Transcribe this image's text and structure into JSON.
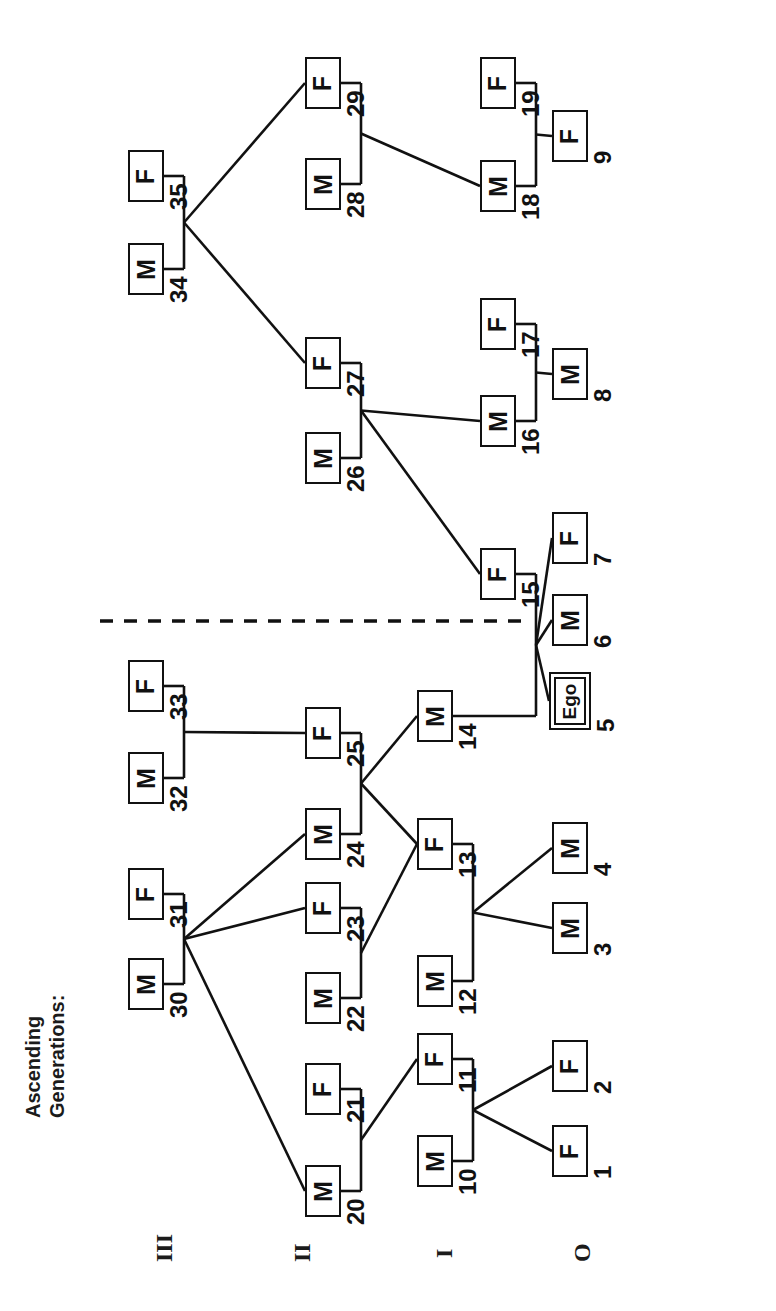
{
  "figure": {
    "caption_line1": "Ascending",
    "caption_line2": "Generations:",
    "orientation": "rotated-90-ccw",
    "ink_color": "#111111",
    "background_color": "#ffffff"
  },
  "generation_labels": [
    {
      "id": "gen-3",
      "label": "III",
      "x": 152,
      "y": 1262
    },
    {
      "id": "gen-2",
      "label": "II",
      "x": 290,
      "y": 1262
    },
    {
      "id": "gen-1",
      "label": "I",
      "x": 432,
      "y": 1258
    },
    {
      "id": "gen-0",
      "label": "O",
      "x": 570,
      "y": 1262
    }
  ],
  "marriage_divider": {
    "name": "descent-reference-dashed-line",
    "x1": 100,
    "y1": 621,
    "x2": 531,
    "y2": 621,
    "style": "dashed"
  },
  "chart_data": {
    "type": "diagram",
    "ego_id": "5",
    "node_count": 35,
    "columns": {
      "III": 150,
      "II": 290,
      "I": 435,
      "0": 570
    },
    "nodes": [
      {
        "id": "1",
        "sex": "F",
        "gen": "0",
        "x": 552,
        "y": 1125,
        "w": 36,
        "h": 52
      },
      {
        "id": "2",
        "sex": "F",
        "gen": "0",
        "x": 552,
        "y": 1040,
        "w": 36,
        "h": 52
      },
      {
        "id": "3",
        "sex": "M",
        "gen": "0",
        "x": 552,
        "y": 902,
        "w": 36,
        "h": 52
      },
      {
        "id": "4",
        "sex": "M",
        "gen": "0",
        "x": 552,
        "y": 822,
        "w": 36,
        "h": 52
      },
      {
        "id": "5",
        "sex": "Ego",
        "gen": "0",
        "x": 549,
        "y": 672,
        "w": 42,
        "h": 58
      },
      {
        "id": "6",
        "sex": "M",
        "gen": "0",
        "x": 552,
        "y": 594,
        "w": 36,
        "h": 52
      },
      {
        "id": "7",
        "sex": "F",
        "gen": "0",
        "x": 552,
        "y": 512,
        "w": 36,
        "h": 52
      },
      {
        "id": "8",
        "sex": "M",
        "gen": "0",
        "x": 552,
        "y": 348,
        "w": 36,
        "h": 52
      },
      {
        "id": "9",
        "sex": "F",
        "gen": "0",
        "x": 552,
        "y": 110,
        "w": 36,
        "h": 52
      },
      {
        "id": "10",
        "sex": "M",
        "gen": "I",
        "x": 417,
        "y": 1135,
        "w": 36,
        "h": 52
      },
      {
        "id": "11",
        "sex": "F",
        "gen": "I",
        "x": 417,
        "y": 1033,
        "w": 36,
        "h": 52
      },
      {
        "id": "12",
        "sex": "M",
        "gen": "I",
        "x": 417,
        "y": 955,
        "w": 36,
        "h": 52
      },
      {
        "id": "13",
        "sex": "F",
        "gen": "I",
        "x": 417,
        "y": 818,
        "w": 36,
        "h": 52
      },
      {
        "id": "14",
        "sex": "M",
        "gen": "I",
        "x": 417,
        "y": 690,
        "w": 36,
        "h": 52
      },
      {
        "id": "15",
        "sex": "F",
        "gen": "I",
        "x": 480,
        "y": 548,
        "w": 36,
        "h": 52
      },
      {
        "id": "16",
        "sex": "M",
        "gen": "I",
        "x": 480,
        "y": 395,
        "w": 36,
        "h": 52
      },
      {
        "id": "17",
        "sex": "F",
        "gen": "I",
        "x": 480,
        "y": 298,
        "w": 36,
        "h": 52
      },
      {
        "id": "18",
        "sex": "M",
        "gen": "I",
        "x": 480,
        "y": 160,
        "w": 36,
        "h": 52
      },
      {
        "id": "19",
        "sex": "F",
        "gen": "I",
        "x": 480,
        "y": 57,
        "w": 36,
        "h": 52
      },
      {
        "id": "20",
        "sex": "M",
        "gen": "II",
        "x": 305,
        "y": 1165,
        "w": 36,
        "h": 52
      },
      {
        "id": "21",
        "sex": "F",
        "gen": "II",
        "x": 305,
        "y": 1063,
        "w": 36,
        "h": 52
      },
      {
        "id": "22",
        "sex": "M",
        "gen": "II",
        "x": 305,
        "y": 972,
        "w": 36,
        "h": 52
      },
      {
        "id": "23",
        "sex": "F",
        "gen": "II",
        "x": 305,
        "y": 882,
        "w": 36,
        "h": 52
      },
      {
        "id": "24",
        "sex": "M",
        "gen": "II",
        "x": 305,
        "y": 808,
        "w": 36,
        "h": 52
      },
      {
        "id": "25",
        "sex": "F",
        "gen": "II",
        "x": 305,
        "y": 707,
        "w": 36,
        "h": 52
      },
      {
        "id": "26",
        "sex": "M",
        "gen": "II",
        "x": 305,
        "y": 432,
        "w": 36,
        "h": 52
      },
      {
        "id": "27",
        "sex": "F",
        "gen": "II",
        "x": 305,
        "y": 337,
        "w": 36,
        "h": 52
      },
      {
        "id": "28",
        "sex": "M",
        "gen": "II",
        "x": 305,
        "y": 158,
        "w": 36,
        "h": 52
      },
      {
        "id": "29",
        "sex": "F",
        "gen": "II",
        "x": 305,
        "y": 57,
        "w": 36,
        "h": 52
      },
      {
        "id": "30",
        "sex": "M",
        "gen": "III",
        "x": 128,
        "y": 958,
        "w": 36,
        "h": 52
      },
      {
        "id": "31",
        "sex": "F",
        "gen": "III",
        "x": 128,
        "y": 868,
        "w": 36,
        "h": 52
      },
      {
        "id": "32",
        "sex": "M",
        "gen": "III",
        "x": 128,
        "y": 752,
        "w": 36,
        "h": 52
      },
      {
        "id": "33",
        "sex": "F",
        "gen": "III",
        "x": 128,
        "y": 660,
        "w": 36,
        "h": 52
      },
      {
        "id": "34",
        "sex": "M",
        "gen": "III",
        "x": 128,
        "y": 243,
        "w": 36,
        "h": 52
      },
      {
        "id": "35",
        "sex": "F",
        "gen": "III",
        "x": 128,
        "y": 150,
        "w": 36,
        "h": 52
      }
    ],
    "marriages": [
      {
        "husband": "10",
        "wife": "11",
        "children": [
          "1",
          "2"
        ]
      },
      {
        "husband": "12",
        "wife": "13",
        "children": [
          "3",
          "4"
        ]
      },
      {
        "husband": "14",
        "wife": "15",
        "children": [
          "5",
          "6",
          "7"
        ]
      },
      {
        "husband": "16",
        "wife": "17",
        "children": [
          "8"
        ]
      },
      {
        "husband": "18",
        "wife": "19",
        "children": [
          "9"
        ]
      },
      {
        "husband": "20",
        "wife": "21",
        "children": [
          "11"
        ]
      },
      {
        "husband": "22",
        "wife": "23",
        "children": [
          "13"
        ]
      },
      {
        "husband": "24",
        "wife": "25",
        "children": [
          "14",
          "13"
        ]
      },
      {
        "husband": "26",
        "wife": "27",
        "children": [
          "15",
          "16"
        ]
      },
      {
        "husband": "28",
        "wife": "29",
        "children": [
          "18"
        ]
      },
      {
        "husband": "30",
        "wife": "31",
        "children": [
          "20",
          "23",
          "24"
        ]
      },
      {
        "husband": "32",
        "wife": "33",
        "children": [
          "25"
        ]
      },
      {
        "husband": "34",
        "wife": "35",
        "children": [
          "29",
          "27"
        ]
      }
    ]
  }
}
